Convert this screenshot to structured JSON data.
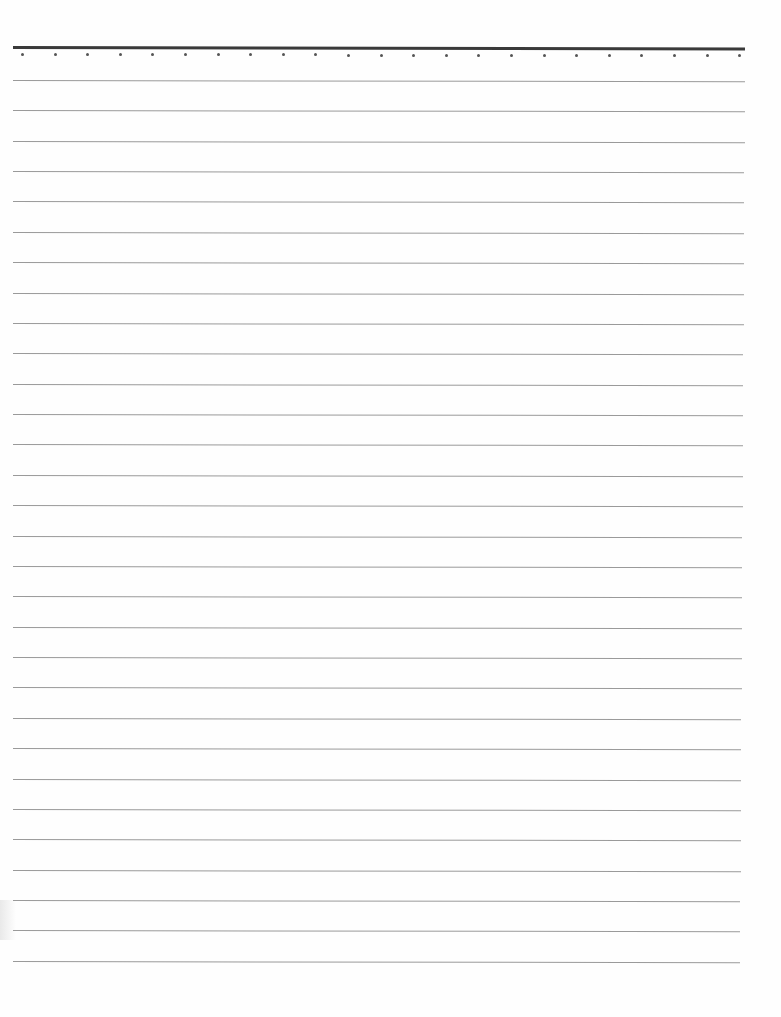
{
  "document": {
    "type": "lined-paper",
    "colors": {
      "paper": "#fefefe",
      "header_rule": "#3a3a3a",
      "line": "#9a9a9a",
      "dot": "#555555"
    },
    "header_rule": {
      "y": 46,
      "x_start": 13,
      "x_end": 745
    },
    "dots": {
      "count": 23,
      "y": 55,
      "x_start": 21,
      "spacing": 32.6
    },
    "lines": {
      "count": 30,
      "y_start": 80,
      "spacing": 30.37,
      "x_start": 13,
      "x_end_top": 745,
      "x_end_bottom": 740
    }
  }
}
